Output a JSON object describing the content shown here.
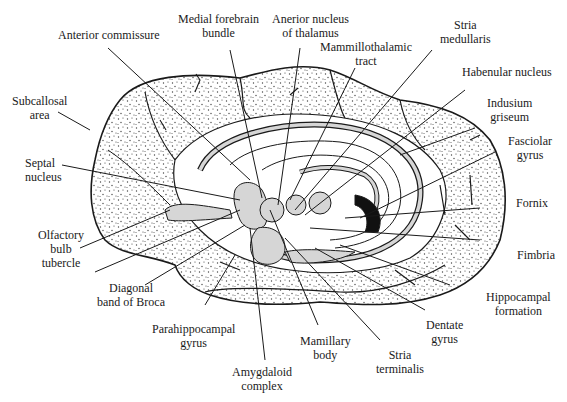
{
  "colors": {
    "background": "#ffffff",
    "line": "#1a1a1a",
    "stipple": "#555555",
    "structure_fill": "#d6d6d6",
    "dark_fill": "#111111"
  },
  "labels": {
    "anterior_commissure": {
      "line1": "Anterior commissure"
    },
    "medial_forebrain_bundle": {
      "line1": "Medial forebrain",
      "line2": "bundle"
    },
    "anterior_nucleus_thalamus": {
      "line1": "Anerior nucleus",
      "line2": "of thalamus"
    },
    "mammillothalamic_tract": {
      "line1": "Mammillothalamic",
      "line2": "tract"
    },
    "stria_medullaris": {
      "line1": "Stria",
      "line2": "medullaris"
    },
    "habenular_nucleus": {
      "line1": "Habenular nucleus"
    },
    "indusium_griseum": {
      "line1": "Indusium",
      "line2": "griseum"
    },
    "fasciolar_gyrus": {
      "line1": "Fasciolar",
      "line2": "gyrus"
    },
    "fornix": {
      "line1": "Fornix"
    },
    "fimbria": {
      "line1": "Fimbria"
    },
    "hippocampal_formation": {
      "line1": "Hippocampal",
      "line2": "formation"
    },
    "dentate_gyrus": {
      "line1": "Dentate",
      "line2": "gyrus"
    },
    "stria_terminalis": {
      "line1": "Stria",
      "line2": "terminalis"
    },
    "mamillary_body": {
      "line1": "Mamillary",
      "line2": "body"
    },
    "amygdaloid_complex": {
      "line1": "Amygdaloid",
      "line2": "complex"
    },
    "parahippocampal_gyrus": {
      "line1": "Parahippocampal",
      "line2": "gyrus"
    },
    "diagonal_band_broca": {
      "line1": "Diagonal",
      "line2": "band of Broca"
    },
    "olfactory_bulb_tubercle": {
      "line1": "Olfactory",
      "line2": "bulb",
      "line3": "tubercle"
    },
    "septal_nucleus": {
      "line1": "Septal",
      "line2": "nucleus"
    },
    "subcallosal_area": {
      "line1": "Subcallosal",
      "line2": "area"
    }
  }
}
